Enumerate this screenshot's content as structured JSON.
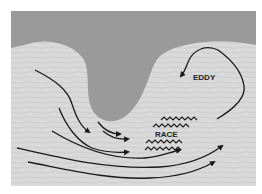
{
  "diagram": {
    "labels": {
      "eddy": "EDDY",
      "race": "RACE"
    },
    "colors": {
      "background": "#ffffff",
      "land": "#9a9a9a",
      "water": "#d9d9d9",
      "water_lines": "#c6c6c6",
      "arrows": "#1a1a1a"
    },
    "regions": [
      "land-headland",
      "sea"
    ],
    "features": [
      "flow-arrows",
      "race-waves",
      "eddy-loop"
    ]
  }
}
